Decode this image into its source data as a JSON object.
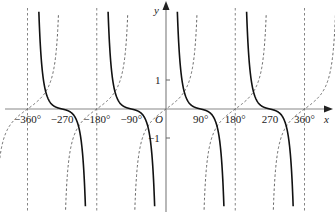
{
  "chart_data": {
    "type": "line",
    "title": "",
    "xlabel": "x",
    "ylabel": "y",
    "origin_label": "O",
    "x_range_deg": [
      -360,
      360
    ],
    "y_range": [
      -3.5,
      3.5
    ],
    "x_ticks": [
      {
        "value": -360,
        "label": "−360°"
      },
      {
        "value": -270,
        "label": "−270"
      },
      {
        "value": -180,
        "label": "−180°"
      },
      {
        "value": -90,
        "label": "−90°"
      },
      {
        "value": 90,
        "label": "90°"
      },
      {
        "value": 180,
        "label": "180°"
      },
      {
        "value": 270,
        "label": "270"
      },
      {
        "value": 360,
        "label": "360°"
      }
    ],
    "y_ticks": [
      {
        "value": 1,
        "label": "1"
      },
      {
        "value": -1,
        "label": "−1"
      }
    ],
    "series": [
      {
        "name": "solid curve (cot-like, period 180°)",
        "style": "solid",
        "color": "#111111",
        "asymptotes_deg": [
          -360,
          -180,
          0,
          180,
          360
        ],
        "zeros_deg": [
          -270,
          -90,
          90,
          270
        ]
      },
      {
        "name": "dashed curve (tan-like, period 180°)",
        "style": "dashed",
        "color": "#555555",
        "asymptotes_deg": [
          -270,
          -90,
          90,
          270
        ],
        "zeros_deg": [
          -360,
          -180,
          0,
          180,
          360
        ]
      }
    ],
    "vertical_dashed_lines_deg": [
      -360,
      -180,
      180,
      360
    ],
    "grid": false,
    "legend": "none"
  }
}
